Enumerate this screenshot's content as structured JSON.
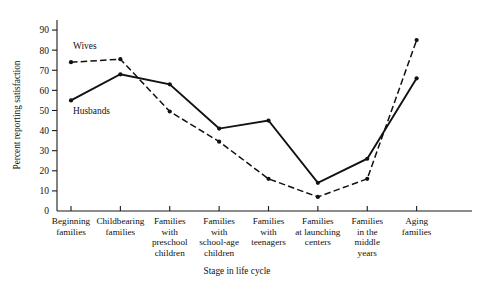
{
  "chart_data": {
    "type": "line",
    "title": "",
    "xlabel": "Stage in life cycle",
    "ylabel": "Percent reporting satisfaction",
    "ylim": [
      0,
      95
    ],
    "yticks": [
      10,
      20,
      30,
      40,
      50,
      60,
      70,
      80,
      90
    ],
    "grid": false,
    "legend_position": "inline-annotation",
    "categories": [
      "Beginning families",
      "Childbearing families",
      "Families with preschool children",
      "Families with school-age children",
      "Families with teenagers",
      "Families at launching centers",
      "Families in the middle years",
      "Aging families"
    ],
    "category_lines": [
      [
        "Beginning",
        "families"
      ],
      [
        "Childbearing",
        "families"
      ],
      [
        "Families",
        "with",
        "preschool",
        "children"
      ],
      [
        "Families",
        "with",
        "school-age",
        "children"
      ],
      [
        "Families",
        "with",
        "teenagers"
      ],
      [
        "Families",
        "at launching",
        "centers"
      ],
      [
        "Families",
        "in the",
        "middle",
        "years"
      ],
      [
        "Aging",
        "families"
      ]
    ],
    "series": [
      {
        "name": "Wives",
        "style": "dashed",
        "values": [
          74,
          75.5,
          49.5,
          34.5,
          16,
          7,
          16,
          85
        ]
      },
      {
        "name": "Husbands",
        "style": "solid",
        "values": [
          55,
          68,
          63,
          41,
          45,
          14,
          26,
          66
        ]
      }
    ],
    "annotations": [
      {
        "text": "Wives",
        "x_index": 0,
        "value": 80.5
      },
      {
        "text": "Husbands",
        "x_index": 0,
        "value": 48
      }
    ],
    "colors": {
      "line": "#111111",
      "axis": "#1a1a1a",
      "background": "#ffffff"
    }
  }
}
